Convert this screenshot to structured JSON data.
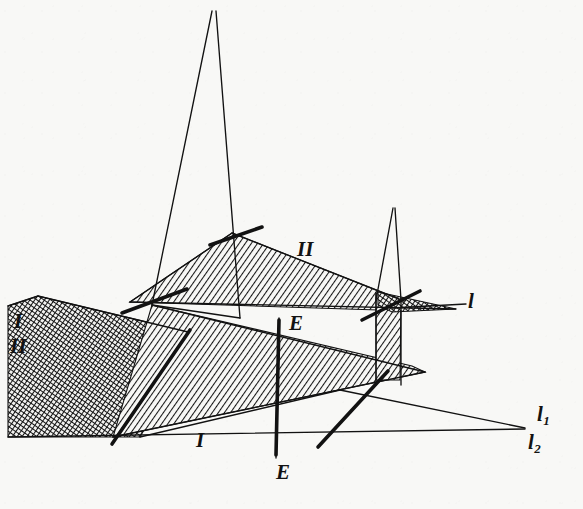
{
  "figure": {
    "kind": "descriptive-geometry-diagram",
    "background_color": "#f8f8f6",
    "ink_color": "#121212",
    "width": 583,
    "height": 509,
    "caption_fragment": ""
  },
  "labels": [
    {
      "id": "plane-I-left",
      "text": "I",
      "x": 14,
      "y": 311,
      "size": "lg",
      "role": "plane-label"
    },
    {
      "id": "plane-II-left",
      "text": "II",
      "x": 10,
      "y": 336,
      "size": "lg",
      "role": "plane-label"
    },
    {
      "id": "plane-II-upper",
      "text": "II",
      "x": 297,
      "y": 239,
      "size": "lg",
      "role": "plane-label"
    },
    {
      "id": "plane-I-lower",
      "text": "I",
      "x": 196,
      "y": 430,
      "size": "lg",
      "role": "plane-label"
    },
    {
      "id": "trace-l",
      "text": "l",
      "x": 468,
      "y": 291,
      "size": "lg",
      "role": "trace-label"
    },
    {
      "id": "axis-E-upper",
      "text": "E",
      "x": 289,
      "y": 313,
      "size": "lg",
      "role": "axis-label"
    },
    {
      "id": "axis-E-lower",
      "text": "E",
      "x": 276,
      "y": 462,
      "size": "lg",
      "role": "axis-label"
    }
  ],
  "subscript_labels": [
    {
      "id": "trace-l1",
      "base": "l",
      "sub": "1",
      "x": 537,
      "y": 404,
      "size": "lg",
      "role": "trace-label"
    },
    {
      "id": "trace-l2",
      "base": "l",
      "sub": "2",
      "x": 528,
      "y": 432,
      "size": "lg",
      "role": "trace-label"
    }
  ],
  "geometry": {
    "regions": [
      {
        "id": "plane-I-II-crosshatch",
        "name": "left-crosshatched-plane",
        "fill": "crosshatch-dark",
        "points": "38,296 188,332 168,388 140,437 8,437 8,306"
      },
      {
        "id": "plane-I-hatch",
        "name": "lower-plane-I",
        "fill": "hatch-diagonal",
        "points": "152,305 412,366 425,372 113,437"
      },
      {
        "id": "plane-II-hatch",
        "name": "upper-plane-II",
        "fill": "hatch-diagonal",
        "points": "232,233 404,301 378,310 130,302"
      },
      {
        "id": "vert-strip-hatch",
        "name": "vertical-strip-right",
        "fill": "hatch-diagonal",
        "points": "376,293 401,298 400,380 376,380"
      },
      {
        "id": "trace-sliver-dark",
        "name": "dark-trace-sliver",
        "fill": "crosshatch-dark",
        "points": "378,292 456,309 392,312 378,305"
      }
    ],
    "thin_lines": [
      {
        "id": "tall-tri-left-leg",
        "x1": 212,
        "y1": 11,
        "x2": 152,
        "y2": 305
      },
      {
        "id": "tall-tri-right-leg",
        "x1": 216,
        "y1": 11,
        "x2": 240,
        "y2": 318
      },
      {
        "id": "tall-tri-base",
        "x1": 152,
        "y1": 305,
        "x2": 240,
        "y2": 318
      },
      {
        "id": "small-tri-left-leg",
        "x1": 393,
        "y1": 208,
        "x2": 376,
        "y2": 300
      },
      {
        "id": "small-tri-right-leg",
        "x1": 395,
        "y1": 208,
        "x2": 401,
        "y2": 300
      },
      {
        "id": "plane-II-top-edge",
        "x1": 232,
        "y1": 233,
        "x2": 404,
        "y2": 301
      },
      {
        "id": "plane-II-left-edge",
        "x1": 232,
        "y1": 233,
        "x2": 130,
        "y2": 302
      },
      {
        "id": "plane-II-base-line",
        "x1": 130,
        "y1": 302,
        "x2": 456,
        "y2": 309
      },
      {
        "id": "plane-I-top-edge",
        "x1": 152,
        "y1": 305,
        "x2": 425,
        "y2": 372
      },
      {
        "id": "plane-I-bottom-edge",
        "x1": 113,
        "y1": 437,
        "x2": 425,
        "y2": 372
      },
      {
        "id": "crosshatch-top-edge",
        "x1": 38,
        "y1": 296,
        "x2": 188,
        "y2": 332
      },
      {
        "id": "crosshatch-left-edge",
        "x1": 38,
        "y1": 296,
        "x2": 8,
        "y2": 306
      },
      {
        "id": "strip-left-edge",
        "x1": 376,
        "y1": 293,
        "x2": 376,
        "y2": 385
      },
      {
        "id": "strip-right-edge",
        "x1": 401,
        "y1": 298,
        "x2": 401,
        "y2": 385
      },
      {
        "id": "trace-l-line",
        "x1": 392,
        "y1": 308,
        "x2": 466,
        "y2": 304
      },
      {
        "id": "trace-l1-line",
        "x1": 340,
        "y1": 390,
        "x2": 525,
        "y2": 428
      },
      {
        "id": "trace-l1-upper",
        "x1": 140,
        "y1": 437,
        "x2": 340,
        "y2": 390
      },
      {
        "id": "trace-l2-line",
        "x1": 8,
        "y1": 437,
        "x2": 525,
        "y2": 429
      },
      {
        "id": "axis-E-vertical",
        "x1": 279,
        "y1": 318,
        "x2": 276,
        "y2": 458
      }
    ],
    "thick_lines": [
      {
        "id": "edge-tick-upper-left",
        "x1": 122,
        "y1": 313,
        "x2": 187,
        "y2": 289
      },
      {
        "id": "edge-tick-crosshatch",
        "x1": 112,
        "y1": 444,
        "x2": 190,
        "y2": 330
      },
      {
        "id": "edge-tick-plane-II",
        "x1": 210,
        "y1": 245,
        "x2": 262,
        "y2": 227
      },
      {
        "id": "edge-tick-right-upper",
        "x1": 362,
        "y1": 320,
        "x2": 420,
        "y2": 291
      },
      {
        "id": "edge-tick-right-lower",
        "x1": 318,
        "y1": 447,
        "x2": 388,
        "y2": 371
      },
      {
        "id": "axis-E-stroke",
        "x1": 279,
        "y1": 320,
        "x2": 276,
        "y2": 455
      }
    ]
  }
}
